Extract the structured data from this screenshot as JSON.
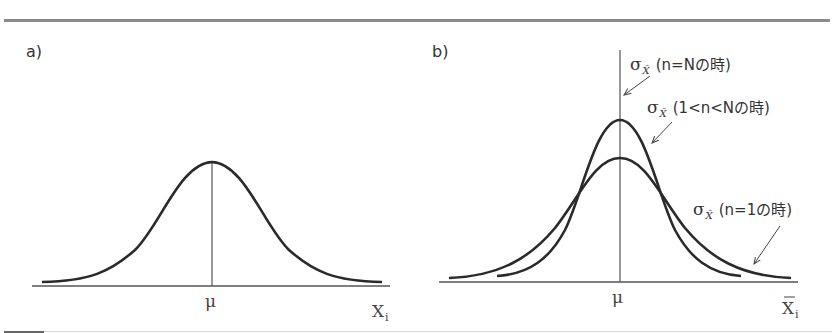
{
  "panels": {
    "a": {
      "label": "a)",
      "center_label": "μ",
      "x_axis_label": "X",
      "x_axis_sub": "i"
    },
    "b": {
      "label": "b)",
      "center_label": "μ",
      "x_axis_label": "X",
      "x_axis_sub": "i",
      "annotations": [
        {
          "sigma": "σ",
          "sub": "X̄",
          "text": "(n=Nの時)"
        },
        {
          "sigma": "σ",
          "sub": "X̄",
          "text": "(1<n<Nの時)"
        },
        {
          "sigma": "σ",
          "sub": "X̄",
          "text": "(n=1の時)"
        }
      ]
    }
  },
  "colors": {
    "curve": "#2a2a2a",
    "axis": "#555555",
    "rule": "#8a8a8a"
  }
}
